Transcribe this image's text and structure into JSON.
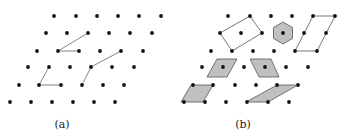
{
  "colors": {
    "dot": "#111111",
    "line": "#777777",
    "fill": "#c0c0c0",
    "outline": "#555555"
  },
  "lattice": {
    "rows": [
      {
        "y": 16,
        "xs": [
          54,
          76,
          97,
          118,
          139,
          161
        ]
      },
      {
        "y": 33,
        "xs": [
          46,
          67,
          88,
          109,
          130,
          152
        ]
      },
      {
        "y": 51,
        "xs": [
          37,
          58,
          79,
          100,
          121,
          143
        ]
      },
      {
        "y": 67,
        "xs": [
          28,
          49,
          70,
          91,
          112,
          134
        ]
      },
      {
        "y": 85,
        "xs": [
          19,
          39,
          61,
          82,
          103,
          124
        ]
      },
      {
        "y": 102,
        "xs": [
          10,
          31,
          52,
          73,
          94,
          115
        ]
      }
    ]
  },
  "panels": [
    {
      "id": "a",
      "label": "(a)",
      "label_pos": [
        62,
        128
      ],
      "offset_x": 0,
      "polylines": [
        [
          [
            88,
            33
          ],
          [
            58,
            51
          ],
          [
            79,
            51
          ]
        ],
        [
          [
            121,
            51
          ],
          [
            91,
            67
          ],
          [
            82,
            85
          ]
        ],
        [
          [
            49,
            67
          ],
          [
            39,
            85
          ],
          [
            61,
            85
          ]
        ]
      ],
      "shapes": []
    },
    {
      "id": "b",
      "label": "(b)",
      "label_pos": [
        243,
        128
      ],
      "offset_x": 174,
      "polylines": [],
      "shapes": [
        {
          "name": "rectangle-cell",
          "filled": false,
          "points": [
            [
              250,
              16
            ],
            [
              262,
              33
            ],
            [
              232,
              51
            ],
            [
              220,
              33
            ]
          ]
        },
        {
          "name": "hexagon-cell",
          "filled": true,
          "hexagon": {
            "cx": 283,
            "cy": 33,
            "r": 11
          }
        },
        {
          "name": "parallelogram-outline",
          "filled": false,
          "points": [
            [
              313,
              16
            ],
            [
              335,
              16
            ],
            [
              317,
              51
            ],
            [
              295,
              51
            ]
          ]
        },
        {
          "name": "rhombus-left",
          "filled": true,
          "points": [
            [
              217,
              59
            ],
            [
              237,
              59
            ],
            [
              227,
              77
            ],
            [
              207,
              77
            ]
          ]
        },
        {
          "name": "rhombus-right",
          "filled": true,
          "points": [
            [
              250,
              59
            ],
            [
              271,
              59
            ],
            [
              279,
              77
            ],
            [
              259,
              77
            ]
          ]
        },
        {
          "name": "parallelogram-bottom-left",
          "filled": true,
          "points": [
            [
              191,
              85
            ],
            [
              213,
              85
            ],
            [
              203,
              102
            ],
            [
              181,
              102
            ]
          ]
        },
        {
          "name": "parallelogram-bottom-long",
          "filled": true,
          "points": [
            [
              277,
              85
            ],
            [
              298,
              85
            ],
            [
              268,
              102
            ],
            [
              246,
              102
            ]
          ]
        }
      ]
    }
  ]
}
